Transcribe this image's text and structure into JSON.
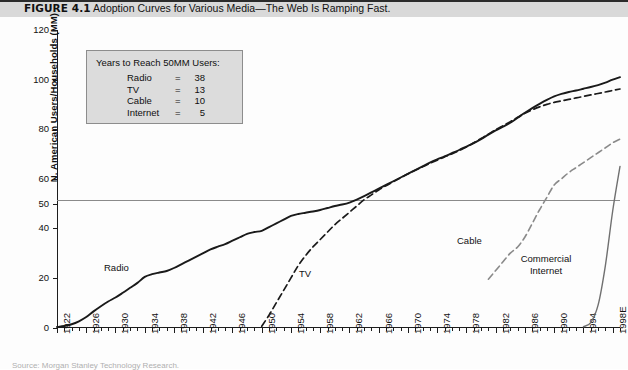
{
  "caption": {
    "figure_label": "FIGURE 4.1",
    "title": "Adoption Curves for Various Media—The Web Is Ramping Fast."
  },
  "legend_box": {
    "title": "Years to Reach 50MM Users:",
    "rows": [
      {
        "name": "Radio",
        "eq": "=",
        "value": "38"
      },
      {
        "name": "TV",
        "eq": "=",
        "value": "13"
      },
      {
        "name": "Cable",
        "eq": "=",
        "value": "10"
      },
      {
        "name": "Internet",
        "eq": "=",
        "value": "5"
      }
    ]
  },
  "series_labels": {
    "radio": "Radio",
    "tv": "TV",
    "cable": "Cable",
    "internet_line1": "Commercial",
    "internet_line2": "Internet"
  },
  "source": "Source: Morgan Stanley Technology Research.",
  "chart_data": {
    "type": "line",
    "title": "Adoption Curves for Various Media—The Web Is Ramping Fast.",
    "xlabel": "",
    "ylabel": "N. American Users/Households (MM)",
    "xlim": [
      1922,
      1999
    ],
    "ylim": [
      0,
      120
    ],
    "yticks": [
      0,
      20,
      40,
      50,
      60,
      80,
      100,
      120
    ],
    "xticks": [
      1922,
      1926,
      1930,
      1934,
      1938,
      1942,
      1946,
      1950,
      1954,
      1958,
      1962,
      1966,
      1970,
      1974,
      1978,
      1982,
      1986,
      1990,
      1994,
      "1998E"
    ],
    "xtick_interval_minor": 1,
    "grid": "single horizontal reference line at y=50",
    "reference_line": {
      "y": 50,
      "color": "#8a8a8a"
    },
    "legend_position": "inline-annotations",
    "series": [
      {
        "name": "Radio",
        "style": "solid",
        "color": "#1a1a1a",
        "width": 1.9,
        "points": [
          [
            1922,
            0.2
          ],
          [
            1923,
            0.6
          ],
          [
            1924,
            1.3
          ],
          [
            1925,
            2.5
          ],
          [
            1926,
            4.2
          ],
          [
            1927,
            6.5
          ],
          [
            1928,
            8.6
          ],
          [
            1929,
            10.5
          ],
          [
            1930,
            12.1
          ],
          [
            1931,
            14.0
          ],
          [
            1932,
            16.0
          ],
          [
            1933,
            18.0
          ],
          [
            1934,
            20.4
          ],
          [
            1935,
            21.5
          ],
          [
            1936,
            22.2
          ],
          [
            1937,
            22.8
          ],
          [
            1938,
            24.0
          ],
          [
            1939,
            25.5
          ],
          [
            1940,
            27.0
          ],
          [
            1941,
            28.5
          ],
          [
            1942,
            30.0
          ],
          [
            1943,
            31.5
          ],
          [
            1944,
            32.6
          ],
          [
            1945,
            33.6
          ],
          [
            1946,
            35.0
          ],
          [
            1947,
            36.4
          ],
          [
            1948,
            37.8
          ],
          [
            1949,
            38.5
          ],
          [
            1950,
            39.0
          ],
          [
            1951,
            40.5
          ],
          [
            1952,
            42.0
          ],
          [
            1953,
            43.5
          ],
          [
            1954,
            45.0
          ],
          [
            1955,
            45.8
          ],
          [
            1956,
            46.3
          ],
          [
            1957,
            46.8
          ],
          [
            1958,
            47.4
          ],
          [
            1959,
            48.2
          ],
          [
            1960,
            49.0
          ],
          [
            1961,
            49.6
          ],
          [
            1962,
            50.4
          ],
          [
            1963,
            51.6
          ],
          [
            1964,
            53.0
          ],
          [
            1965,
            54.5
          ],
          [
            1966,
            56.0
          ],
          [
            1967,
            57.5
          ],
          [
            1968,
            59.0
          ],
          [
            1969,
            60.5
          ],
          [
            1970,
            62.0
          ],
          [
            1971,
            63.5
          ],
          [
            1972,
            65.0
          ],
          [
            1973,
            66.5
          ],
          [
            1974,
            67.8
          ],
          [
            1975,
            69.0
          ],
          [
            1976,
            70.3
          ],
          [
            1977,
            71.6
          ],
          [
            1978,
            73.0
          ],
          [
            1979,
            74.4
          ],
          [
            1980,
            76.0
          ],
          [
            1981,
            77.8
          ],
          [
            1982,
            79.5
          ],
          [
            1983,
            81.0
          ],
          [
            1984,
            82.6
          ],
          [
            1985,
            84.6
          ],
          [
            1986,
            86.6
          ],
          [
            1987,
            88.5
          ],
          [
            1988,
            90.2
          ],
          [
            1989,
            91.8
          ],
          [
            1990,
            93.2
          ],
          [
            1991,
            94.2
          ],
          [
            1992,
            95.0
          ],
          [
            1993,
            95.6
          ],
          [
            1994,
            96.3
          ],
          [
            1995,
            97.0
          ],
          [
            1996,
            97.8
          ],
          [
            1997,
            98.8
          ],
          [
            1998,
            100.0
          ],
          [
            1999,
            101.0
          ]
        ]
      },
      {
        "name": "TV",
        "style": "dashed",
        "color": "#1a1a1a",
        "width": 1.7,
        "points": [
          [
            1950,
            0.5
          ],
          [
            1951,
            5.0
          ],
          [
            1952,
            10.0
          ],
          [
            1953,
            15.0
          ],
          [
            1954,
            20.0
          ],
          [
            1955,
            25.0
          ],
          [
            1956,
            29.0
          ],
          [
            1957,
            32.5
          ],
          [
            1958,
            35.5
          ],
          [
            1959,
            38.5
          ],
          [
            1960,
            41.5
          ],
          [
            1961,
            44.0
          ],
          [
            1962,
            46.5
          ],
          [
            1963,
            49.0
          ],
          [
            1964,
            51.5
          ],
          [
            1965,
            53.5
          ],
          [
            1966,
            55.5
          ],
          [
            1967,
            57.2
          ],
          [
            1968,
            58.8
          ],
          [
            1969,
            60.4
          ],
          [
            1970,
            62.0
          ],
          [
            1971,
            63.4
          ],
          [
            1972,
            64.8
          ],
          [
            1973,
            66.2
          ],
          [
            1974,
            67.5
          ],
          [
            1975,
            68.8
          ],
          [
            1976,
            70.0
          ],
          [
            1977,
            71.4
          ],
          [
            1978,
            72.8
          ],
          [
            1979,
            74.5
          ],
          [
            1980,
            76.2
          ],
          [
            1981,
            78.0
          ],
          [
            1982,
            79.8
          ],
          [
            1983,
            81.4
          ],
          [
            1984,
            83.0
          ],
          [
            1985,
            84.8
          ],
          [
            1986,
            86.4
          ],
          [
            1987,
            87.8
          ],
          [
            1988,
            89.0
          ],
          [
            1989,
            90.0
          ],
          [
            1990,
            90.8
          ],
          [
            1991,
            91.4
          ],
          [
            1992,
            92.0
          ],
          [
            1993,
            92.6
          ],
          [
            1994,
            93.2
          ],
          [
            1995,
            93.8
          ],
          [
            1996,
            94.4
          ],
          [
            1997,
            95.0
          ],
          [
            1998,
            95.6
          ],
          [
            1999,
            96.2
          ]
        ]
      },
      {
        "name": "Cable",
        "style": "dashed",
        "color": "#8a8a8a",
        "width": 1.6,
        "points": [
          [
            1981,
            19.5
          ],
          [
            1982,
            23.0
          ],
          [
            1983,
            26.5
          ],
          [
            1984,
            30.0
          ],
          [
            1985,
            32.5
          ],
          [
            1986,
            36.5
          ],
          [
            1987,
            42.0
          ],
          [
            1988,
            47.5
          ],
          [
            1989,
            52.5
          ],
          [
            1990,
            57.5
          ],
          [
            1991,
            60.0
          ],
          [
            1992,
            62.5
          ],
          [
            1993,
            64.5
          ],
          [
            1994,
            66.5
          ],
          [
            1995,
            68.5
          ],
          [
            1996,
            70.5
          ],
          [
            1997,
            72.5
          ],
          [
            1998,
            74.5
          ],
          [
            1999,
            76.0
          ]
        ]
      },
      {
        "name": "Commercial Internet",
        "style": "solid",
        "color": "#707070",
        "width": 1.4,
        "points": [
          [
            1994,
            0.3
          ],
          [
            1995,
            2.0
          ],
          [
            1996,
            9.0
          ],
          [
            1997,
            25.0
          ],
          [
            1998,
            47.0
          ],
          [
            1999,
            65.0
          ]
        ]
      }
    ]
  }
}
